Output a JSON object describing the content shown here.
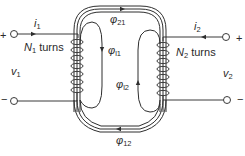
{
  "diagram": {
    "left_port": {
      "plus": "+",
      "minus": "−",
      "current": {
        "symbol": "i",
        "subscript": "1"
      },
      "voltage": {
        "symbol": "v",
        "subscript": "1"
      },
      "coil": {
        "symbol": "N",
        "subscript": "1",
        "suffix": " turns"
      }
    },
    "right_port": {
      "plus": "+",
      "minus": "−",
      "current": {
        "symbol": "i",
        "subscript": "2"
      },
      "voltage": {
        "symbol": "v",
        "subscript": "2"
      },
      "coil": {
        "symbol": "N",
        "subscript": "2",
        "suffix": " turns"
      }
    },
    "fluxes": [
      {
        "id": "phi21",
        "symbol": "φ",
        "subscript": "21",
        "description": "mutual flux from coil 1 linking coil 2 (top path, arrow rightward)"
      },
      {
        "id": "phil1",
        "symbol": "φ",
        "subscript": "l1",
        "description": "leakage flux of coil 1 (arrow downward)"
      },
      {
        "id": "phil2",
        "symbol": "φ",
        "subscript": "l2",
        "description": "leakage flux of coil 2 (arrow upward)"
      },
      {
        "id": "phi12",
        "symbol": "φ",
        "subscript": "12",
        "description": "mutual flux from coil 2 linking coil 1 (bottom path, arrow leftward)"
      }
    ],
    "colors": {
      "ink": "#2e2e2e",
      "background": "#ffffff"
    }
  }
}
